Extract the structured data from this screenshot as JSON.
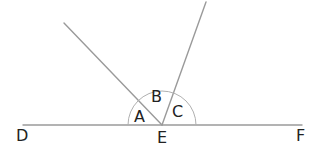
{
  "diagram": {
    "type": "angles-on-a-straight-line",
    "points": {
      "D": {
        "label": "D",
        "x": 22,
        "y": 139
      },
      "E": {
        "label": "E",
        "x": 162,
        "y": 141
      },
      "F": {
        "label": "F",
        "x": 302,
        "y": 139
      }
    },
    "angles": {
      "A": {
        "label": "A",
        "x": 141,
        "y": 121
      },
      "B": {
        "label": "B",
        "x": 157,
        "y": 101
      },
      "C": {
        "label": "C",
        "x": 179,
        "y": 115
      }
    },
    "colors": {
      "line": "#9a9a9a",
      "arc": "#b0b0b0",
      "text": "#222222",
      "background": "#ffffff"
    }
  }
}
